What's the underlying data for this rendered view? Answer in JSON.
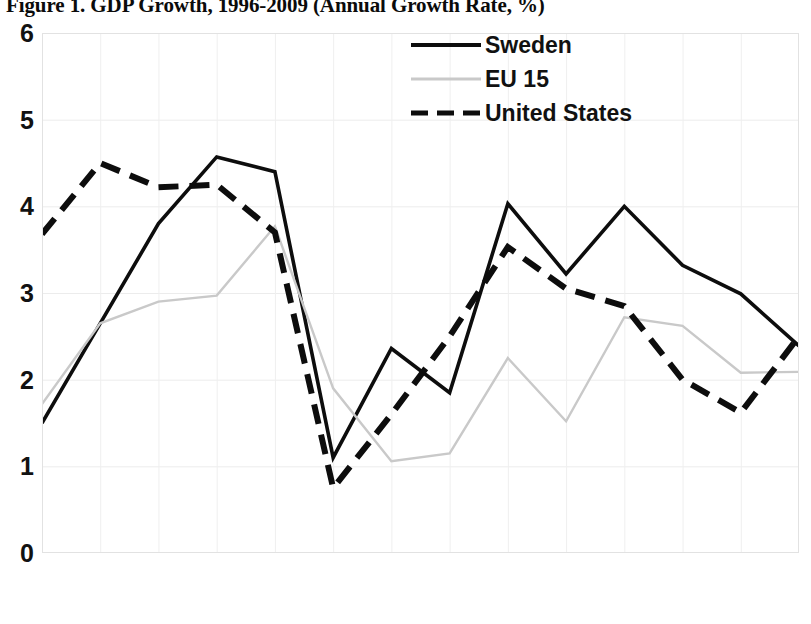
{
  "title": "Figure 1. GDP Growth, 1996-2009 (Annual Growth Rate, %)",
  "legend": {
    "items": [
      {
        "label": "Sweden",
        "style": "solid",
        "color": "#0d0d0d",
        "swatch_name": "legend-swatch-sweden"
      },
      {
        "label": "EU 15",
        "style": "solid-light",
        "color": "#c9c9c9",
        "swatch_name": "legend-swatch-eu15"
      },
      {
        "label": "United States",
        "style": "dashed",
        "color": "#0d0d0d",
        "swatch_name": "legend-swatch-united-states"
      }
    ]
  },
  "axes": {
    "y_ticks": [
      "0",
      "1",
      "2",
      "3",
      "4",
      "5",
      "6"
    ],
    "x_ticks": [
      "1996",
      "1997",
      "1998",
      "1999",
      "2000",
      "2001",
      "2002",
      "2003",
      "2004",
      "2005",
      "2006",
      "2007",
      "2008",
      "2009"
    ]
  },
  "chart_data": {
    "type": "line",
    "title": "Figure 1. GDP Growth, 1996-2009 (Annual Growth Rate, %)",
    "xlabel": "",
    "ylabel": "",
    "ylim": [
      0,
      6
    ],
    "ytick_step": 1,
    "grid": true,
    "legend_position": "top-right-inside",
    "categories": [
      "1996",
      "1997",
      "1998",
      "1999",
      "2000",
      "2001",
      "2002",
      "2003",
      "2004",
      "2005",
      "2006",
      "2007",
      "2008",
      "2009"
    ],
    "series": [
      {
        "name": "Sweden",
        "color": "#0d0d0d",
        "style": "solid",
        "values": [
          1.5,
          2.65,
          3.8,
          4.57,
          4.4,
          1.1,
          2.36,
          1.85,
          4.03,
          3.22,
          4.0,
          3.32,
          2.99,
          2.39
        ]
      },
      {
        "name": "EU 15",
        "color": "#c9c9c9",
        "style": "solid",
        "values": [
          1.72,
          2.65,
          2.9,
          2.97,
          3.77,
          1.9,
          1.06,
          1.15,
          2.25,
          1.52,
          2.72,
          2.62,
          2.08,
          2.09
        ]
      },
      {
        "name": "United States",
        "color": "#0d0d0d",
        "style": "dashed",
        "values": [
          3.68,
          4.5,
          4.22,
          4.25,
          3.7,
          0.75,
          1.6,
          2.5,
          3.53,
          3.05,
          2.85,
          2.0,
          1.62,
          2.5
        ]
      }
    ]
  }
}
